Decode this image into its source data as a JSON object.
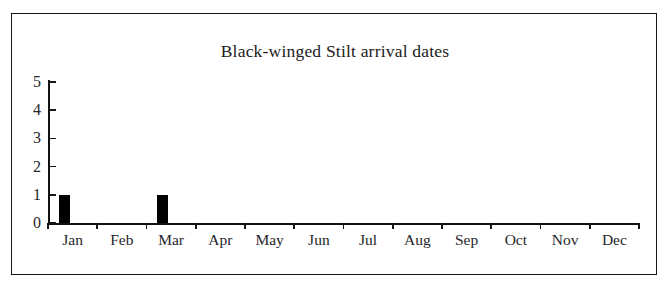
{
  "figure": {
    "title": "Black-winged Stilt arrival dates",
    "frame_color": "#15151a",
    "background": "#ffffff",
    "bar_color": "#000000"
  },
  "chart_data": {
    "type": "bar",
    "title": "Black-winged Stilt arrival dates",
    "xlabel": "",
    "ylabel": "",
    "categories": [
      "Jan",
      "Feb",
      "Mar",
      "Apr",
      "May",
      "Jun",
      "Jul",
      "Aug",
      "Sep",
      "Oct",
      "Nov",
      "Dec"
    ],
    "values": [
      1,
      0,
      1,
      0,
      0,
      0,
      0,
      0,
      0,
      0,
      0,
      0
    ],
    "ylim": [
      0,
      5
    ],
    "yticks": [
      "0",
      "1",
      "2",
      "3",
      "4",
      "5"
    ],
    "ytick_values": [
      0,
      1,
      2,
      3,
      4,
      5
    ],
    "grid": false,
    "legend": null,
    "series": [
      {
        "name": "arrivals",
        "values": [
          1,
          0,
          1,
          0,
          0,
          0,
          0,
          0,
          0,
          0,
          0,
          0
        ]
      }
    ]
  }
}
